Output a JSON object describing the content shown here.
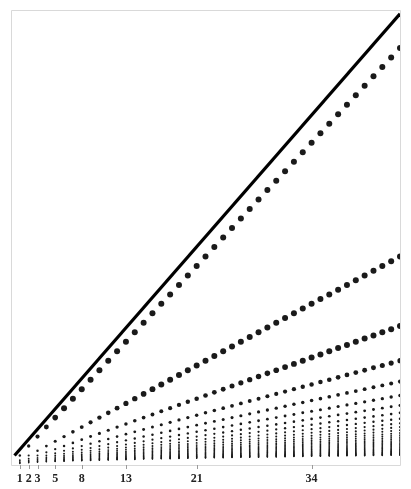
{
  "figure": {
    "background_color": "#ffffff",
    "frame_color": "#d9d9d9",
    "frame": {
      "left": 11,
      "top": 10,
      "right": 400,
      "bottom": 465
    },
    "tick_color": "#9a9a9a",
    "tick_length": 4,
    "point_color": "#1a1a1a",
    "diagonal_color": "#000000",
    "diagonal_width": 3.2
  },
  "chart_data": {
    "type": "scatter",
    "title": "",
    "subtitle": "",
    "xlabel": "",
    "ylabel": "",
    "grid": false,
    "legend": null,
    "xlim": [
      0,
      44
    ],
    "ylim": [
      0,
      48
    ],
    "x_ticks": [
      1,
      2,
      3,
      5,
      8,
      13,
      21,
      34
    ],
    "x_tick_labels": [
      "1",
      "2",
      "3",
      "5",
      "8",
      "13",
      "21",
      "34"
    ],
    "y_ticks": [],
    "y_tick_labels": [],
    "annotations": [
      {
        "kind": "line",
        "name": "identity-diagonal",
        "x": [
          0.4,
          44.0
        ],
        "y": [
          1.0,
          47.6
        ]
      }
    ],
    "series": [
      {
        "name": "divisor-columns",
        "generator": "for n in 1..44: points at y = n/k for k = 1..K(n)",
        "n_min": 1,
        "n_max": 44,
        "marker_min_px": 0.7,
        "marker_max_px": 3.0
      }
    ]
  },
  "axis": {
    "ticks": [
      {
        "value": 1,
        "label": "1"
      },
      {
        "value": 2,
        "label": "2"
      },
      {
        "value": 3,
        "label": "3"
      },
      {
        "value": 5,
        "label": "5"
      },
      {
        "value": 8,
        "label": "8"
      },
      {
        "value": 13,
        "label": "13"
      },
      {
        "value": 21,
        "label": "21"
      },
      {
        "value": 34,
        "label": "34"
      }
    ]
  }
}
